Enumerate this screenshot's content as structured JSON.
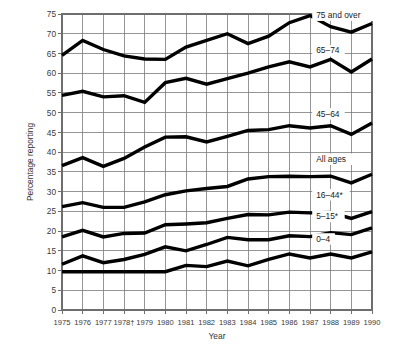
{
  "chart_data": {
    "type": "line",
    "title": "",
    "xlabel": "Year",
    "ylabel": "Percentage reporting",
    "xlim": [
      1975,
      1990
    ],
    "ylim": [
      0,
      75
    ],
    "ytick_step": 5,
    "grid": true,
    "legend_position": "inline-right",
    "footnote_markers": [
      "1978†",
      "16–44*",
      "5–15*"
    ],
    "x": [
      1975,
      1976,
      1977,
      1978,
      1979,
      1980,
      1981,
      1982,
      1983,
      1984,
      1985,
      1986,
      1987,
      1988,
      1989,
      1990
    ],
    "xtick_labels": [
      "1975",
      "1976",
      "1977",
      "1978†",
      "1979",
      "1980",
      "1981",
      "1982",
      "1983",
      "1984",
      "1985",
      "1986",
      "1987",
      "1988",
      "1989",
      "1990"
    ],
    "ytick_labels": [
      "0",
      "5",
      "10",
      "15",
      "20",
      "25",
      "30",
      "35",
      "40",
      "45",
      "50",
      "55",
      "60",
      "65",
      "70",
      "75"
    ],
    "series": [
      {
        "name": "75 and over",
        "label": "75 and over",
        "color": "#000000",
        "values": [
          64.5,
          68.3,
          66.0,
          64.4,
          63.6,
          63.5,
          66.6,
          68.3,
          70.0,
          67.5,
          69.4,
          72.8,
          74.6,
          71.8,
          70.4,
          72.6
        ]
      },
      {
        "name": "65-74",
        "label": "65–74",
        "color": "#000000",
        "values": [
          54.4,
          55.4,
          54.0,
          54.3,
          52.6,
          57.6,
          58.7,
          57.2,
          58.6,
          60.0,
          61.6,
          62.9,
          61.6,
          63.5,
          60.3,
          63.6
        ]
      },
      {
        "name": "45-64",
        "label": "45–64",
        "color": "#000000",
        "values": [
          36.6,
          38.6,
          36.4,
          38.4,
          41.3,
          43.8,
          43.9,
          42.6,
          44.0,
          45.5,
          45.7,
          46.7,
          46.1,
          46.7,
          44.5,
          47.4
        ]
      },
      {
        "name": "All ages",
        "label": "All ages",
        "color": "#000000",
        "values": [
          26.2,
          27.2,
          26.0,
          26.0,
          27.4,
          29.2,
          30.2,
          30.8,
          31.3,
          33.2,
          33.8,
          33.9,
          33.8,
          33.9,
          32.2,
          34.4
        ]
      },
      {
        "name": "16-44*",
        "label": "16–44*",
        "color": "#000000",
        "values": [
          18.5,
          20.2,
          18.5,
          19.4,
          19.5,
          21.6,
          21.8,
          22.1,
          23.2,
          24.2,
          24.1,
          24.8,
          24.6,
          24.7,
          23.2,
          24.9
        ]
      },
      {
        "name": "5-15*",
        "label": "5–15*",
        "color": "#000000",
        "values": [
          11.6,
          13.7,
          12.0,
          12.8,
          14.1,
          16.0,
          15.0,
          16.6,
          18.4,
          17.8,
          17.8,
          18.8,
          18.6,
          19.6,
          19.1,
          20.8
        ]
      },
      {
        "name": "0-4",
        "label": "0–4",
        "color": "#000000",
        "values": [
          9.7,
          9.7,
          9.7,
          9.7,
          9.7,
          9.7,
          11.3,
          11.0,
          12.4,
          11.2,
          12.8,
          14.2,
          13.2,
          14.2,
          13.2,
          14.7
        ]
      }
    ],
    "series_label_positions": [
      {
        "name": "75 and over",
        "x": 1987.3,
        "y": 74.0
      },
      {
        "name": "65-74",
        "x": 1987.3,
        "y": 65.0
      },
      {
        "name": "45-64",
        "x": 1987.3,
        "y": 49.0
      },
      {
        "name": "All ages",
        "x": 1987.3,
        "y": 37.5
      },
      {
        "name": "16-44*",
        "x": 1987.3,
        "y": 28.5
      },
      {
        "name": "5-15*",
        "x": 1987.3,
        "y": 23.0
      },
      {
        "name": "0-4",
        "x": 1987.3,
        "y": 17.3
      }
    ]
  }
}
